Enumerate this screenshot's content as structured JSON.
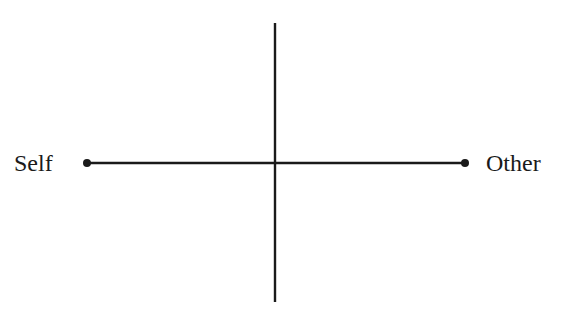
{
  "diagram": {
    "type": "axis-cross",
    "horizontal_axis": {
      "left_label": "Self",
      "right_label": "Other",
      "endpoints": "dots"
    },
    "vertical_axis": {
      "top_label": "",
      "bottom_label": ""
    },
    "line_color": "#1a1a1a"
  }
}
